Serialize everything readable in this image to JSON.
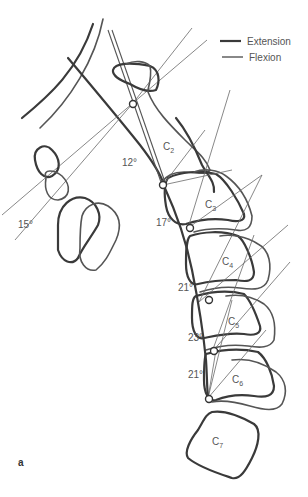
{
  "figure": {
    "panel_label": "a",
    "legend": [
      {
        "label": "Extension",
        "style": "thick line"
      },
      {
        "label": "Flexion",
        "style": "thin line"
      }
    ],
    "vertebrae": [
      {
        "base": "C",
        "sub": "2"
      },
      {
        "base": "C",
        "sub": "3"
      },
      {
        "base": "C",
        "sub": "4"
      },
      {
        "base": "C",
        "sub": "5"
      },
      {
        "base": "C",
        "sub": "6"
      },
      {
        "base": "C",
        "sub": "7"
      }
    ],
    "angles": [
      {
        "segment": "Occiput-C1",
        "value": "15°"
      },
      {
        "segment": "C1-C2",
        "value": "12°"
      },
      {
        "segment": "C2-C3",
        "value": "17°"
      },
      {
        "segment": "C3-C4",
        "value": "21°"
      },
      {
        "segment": "C4-C5",
        "value": "23°"
      },
      {
        "segment": "C5-C6",
        "value": "21°"
      }
    ]
  }
}
